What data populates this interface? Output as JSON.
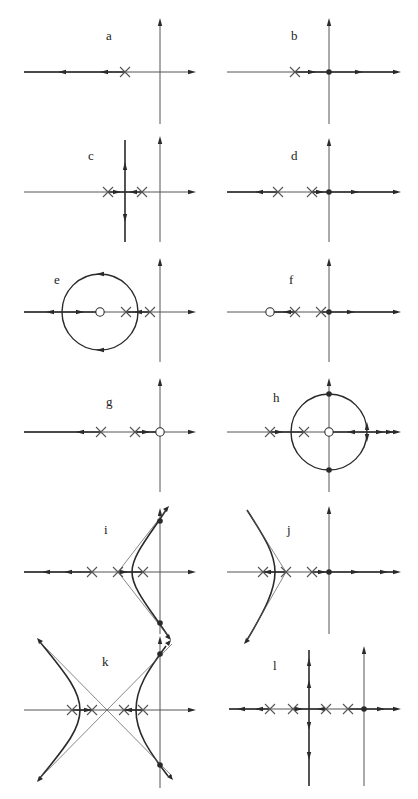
{
  "figure": {
    "ink_color": "#2a2a2a",
    "faint_color": "#555555"
  },
  "panels": [
    {
      "id": "a",
      "label": "a",
      "x": 0,
      "y": 0,
      "label_pos": [
        106,
        40
      ],
      "origin": [
        160,
        72
      ],
      "axes": {
        "left": 24,
        "right": 192,
        "top": 22,
        "bottom": 124
      },
      "poles": [
        [
          125,
          72
        ]
      ],
      "zeros": [],
      "dots": [],
      "lines": [
        [
          [
            24,
            72
          ],
          [
            125,
            72
          ]
        ]
      ],
      "circles": [],
      "curves": [],
      "dashed": [],
      "arrows": [
        [
          62,
          72,
          "left"
        ],
        [
          104,
          72,
          "left"
        ]
      ]
    },
    {
      "id": "b",
      "label": "b",
      "x": 209,
      "y": 0,
      "label_pos": [
        82,
        40
      ],
      "origin": [
        120,
        72
      ],
      "axes": {
        "left": 18,
        "right": 188,
        "top": 22,
        "bottom": 124
      },
      "poles": [
        [
          86,
          72
        ]
      ],
      "zeros": [],
      "dots": [
        [
          120,
          72
        ]
      ],
      "lines": [
        [
          [
            86,
            72
          ],
          [
            188,
            72
          ]
        ]
      ],
      "circles": [],
      "curves": [],
      "dashed": [],
      "arrows": [
        [
          103,
          72,
          "right"
        ],
        [
          150,
          72,
          "right"
        ]
      ]
    },
    {
      "id": "c",
      "label": "c",
      "x": 0,
      "y": 130,
      "label_pos": [
        88,
        30
      ],
      "origin": [
        160,
        62
      ],
      "axes": {
        "left": 24,
        "right": 192,
        "top": 10,
        "bottom": 112
      },
      "poles": [
        [
          108,
          62
        ],
        [
          142,
          62
        ]
      ],
      "zeros": [],
      "dots": [],
      "lines": [
        [
          [
            108,
            62
          ],
          [
            142,
            62
          ]
        ],
        [
          [
            125,
            10
          ],
          [
            125,
            112
          ]
        ]
      ],
      "circles": [],
      "curves": [],
      "dashed": [],
      "arrows": [
        [
          117,
          62,
          "right"
        ],
        [
          133,
          62,
          "left"
        ],
        [
          125,
          36,
          "up"
        ],
        [
          125,
          88,
          "down"
        ]
      ]
    },
    {
      "id": "d",
      "label": "d",
      "x": 209,
      "y": 130,
      "label_pos": [
        82,
        30
      ],
      "origin": [
        120,
        62
      ],
      "axes": {
        "left": 18,
        "right": 188,
        "top": 12,
        "bottom": 112
      },
      "poles": [
        [
          69,
          62
        ],
        [
          103,
          62
        ]
      ],
      "zeros": [],
      "dots": [
        [
          120,
          62
        ]
      ],
      "lines": [
        [
          [
            18,
            62
          ],
          [
            69,
            62
          ]
        ],
        [
          [
            103,
            62
          ],
          [
            188,
            62
          ]
        ]
      ],
      "circles": [],
      "curves": [],
      "dashed": [],
      "arrows": [
        [
          50,
          62,
          "left"
        ],
        [
          111,
          62,
          "right"
        ],
        [
          146,
          62,
          "right"
        ]
      ]
    },
    {
      "id": "e",
      "label": "e",
      "x": 0,
      "y": 250,
      "label_pos": [
        54,
        34
      ],
      "origin": [
        160,
        62
      ],
      "axes": {
        "left": 24,
        "right": 192,
        "top": 12,
        "bottom": 112
      },
      "poles": [
        [
          126,
          62
        ],
        [
          150,
          62
        ]
      ],
      "zeros": [
        [
          100,
          62
        ]
      ],
      "dots": [],
      "lines": [
        [
          [
            24,
            62
          ],
          [
            100,
            62
          ]
        ],
        [
          [
            126,
            62
          ],
          [
            150,
            62
          ]
        ]
      ],
      "circles": [
        [
          100,
          62,
          38
        ]
      ],
      "curves": [],
      "dashed": [],
      "arrows": [
        [
          50,
          62,
          "left"
        ],
        [
          80,
          62,
          "right"
        ],
        [
          138,
          62,
          "left"
        ],
        [
          100,
          24,
          "left"
        ],
        [
          100,
          100,
          "left"
        ]
      ]
    },
    {
      "id": "f",
      "label": "f",
      "x": 209,
      "y": 250,
      "label_pos": [
        80,
        34
      ],
      "origin": [
        120,
        62
      ],
      "axes": {
        "left": 18,
        "right": 188,
        "top": 12,
        "bottom": 112
      },
      "poles": [
        [
          86,
          62
        ],
        [
          112,
          62
        ]
      ],
      "zeros": [
        [
          61,
          62
        ]
      ],
      "dots": [
        [
          120,
          62
        ]
      ],
      "lines": [
        [
          [
            61,
            62
          ],
          [
            86,
            62
          ]
        ],
        [
          [
            112,
            62
          ],
          [
            188,
            62
          ]
        ]
      ],
      "circles": [],
      "curves": [],
      "dashed": [],
      "arrows": [
        [
          78,
          62,
          "left"
        ],
        [
          142,
          62,
          "right"
        ]
      ]
    },
    {
      "id": "g",
      "label": "g",
      "x": 0,
      "y": 380,
      "label_pos": [
        106,
        26
      ],
      "origin": [
        160,
        52
      ],
      "axes": {
        "left": 24,
        "right": 192,
        "top": 2,
        "bottom": 112
      },
      "poles": [
        [
          101,
          52
        ],
        [
          135,
          52
        ]
      ],
      "zeros": [
        [
          160,
          52
        ]
      ],
      "dots": [],
      "lines": [
        [
          [
            24,
            52
          ],
          [
            101,
            52
          ]
        ],
        [
          [
            135,
            52
          ],
          [
            160,
            52
          ]
        ]
      ],
      "circles": [],
      "curves": [],
      "dashed": [],
      "arrows": [
        [
          80,
          52,
          "left"
        ],
        [
          146,
          52,
          "right"
        ]
      ]
    },
    {
      "id": "h",
      "label": "h",
      "x": 209,
      "y": 380,
      "label_pos": [
        64,
        22
      ],
      "origin": [
        120,
        52
      ],
      "axes": {
        "left": 18,
        "right": 188,
        "top": 2,
        "bottom": 112
      },
      "poles": [
        [
          61,
          52
        ],
        [
          95,
          52
        ]
      ],
      "zeros": [
        [
          120,
          52
        ]
      ],
      "dots": [
        [
          120,
          14
        ],
        [
          120,
          90
        ]
      ],
      "lines": [
        [
          [
            61,
            52
          ],
          [
            95,
            52
          ]
        ],
        [
          [
            120,
            52
          ],
          [
            188,
            52
          ]
        ]
      ],
      "circles": [
        [
          120,
          52,
          38
        ]
      ],
      "curves": [],
      "dashed": [],
      "arrows": [
        [
          70,
          52,
          "right"
        ],
        [
          142,
          52,
          "left"
        ],
        [
          171,
          52,
          "right"
        ],
        [
          181,
          52,
          "right"
        ],
        [
          158,
          46,
          "up"
        ],
        [
          158,
          58,
          "down"
        ]
      ]
    },
    {
      "id": "i",
      "label": "i",
      "x": 0,
      "y": 510,
      "label_pos": [
        104,
        24
      ],
      "origin": [
        160,
        62
      ],
      "axes": {
        "left": 24,
        "right": 192,
        "top": 2,
        "bottom": 124
      },
      "poles": [
        [
          92,
          62
        ],
        [
          118,
          62
        ],
        [
          143,
          62
        ]
      ],
      "zeros": [],
      "dots": [
        [
          160,
          11
        ],
        [
          160,
          113
        ]
      ],
      "lines": [
        [
          [
            24,
            62
          ],
          [
            92,
            62
          ]
        ],
        [
          [
            118,
            62
          ],
          [
            143,
            62
          ]
        ]
      ],
      "circles": [],
      "curves": [
        "M 166 0 C 150 25, 132 45, 132 62 C 132 79, 150 99, 168 126"
      ],
      "dashed": [
        [
          "M 118 62 L 166 0"
        ],
        [
          "M 118 62 L 168 126"
        ]
      ],
      "arrows": [
        [
          46,
          62,
          "left"
        ],
        [
          68,
          62,
          "left"
        ],
        [
          124,
          62,
          "right"
        ],
        [
          166,
          0,
          "upright"
        ],
        [
          168,
          126,
          "downright"
        ]
      ]
    },
    {
      "id": "j",
      "label": "j",
      "x": 209,
      "y": 510,
      "label_pos": [
        78,
        24
      ],
      "origin": [
        120,
        62
      ],
      "axes": {
        "left": 18,
        "right": 188,
        "top": 0,
        "bottom": 124
      },
      "poles": [
        [
          54,
          62
        ],
        [
          77,
          62
        ],
        [
          103,
          62
        ]
      ],
      "zeros": [],
      "dots": [
        [
          120,
          62
        ]
      ],
      "lines": [
        [
          [
            54,
            62
          ],
          [
            77,
            62
          ]
        ],
        [
          [
            103,
            62
          ],
          [
            188,
            62
          ]
        ]
      ],
      "circles": [],
      "curves": [
        "M 38 0 C 56 28, 66 44, 66 62 C 66 80, 56 100, 38 130"
      ],
      "dashed": [
        [
          "M 77 62 L 38 0"
        ],
        [
          "M 77 62 L 38 130"
        ]
      ],
      "arrows": [
        [
          58,
          62,
          "left"
        ],
        [
          113,
          62,
          "right"
        ],
        [
          146,
          62,
          "right"
        ],
        [
          175,
          62,
          "right"
        ],
        [
          38,
          130,
          "downleft"
        ]
      ]
    },
    {
      "id": "k",
      "label": "k",
      "x": 0,
      "y": 640,
      "label_pos": [
        102,
        26
      ],
      "origin": [
        160,
        70
      ],
      "axes": {
        "left": 24,
        "right": 192,
        "top": 0,
        "bottom": 148
      },
      "poles": [
        [
          72,
          70
        ],
        [
          92,
          70
        ],
        [
          124,
          70
        ],
        [
          143,
          70
        ]
      ],
      "zeros": [],
      "dots": [
        [
          160,
          14
        ],
        [
          160,
          125
        ]
      ],
      "lines": [
        [
          [
            72,
            70
          ],
          [
            92,
            70
          ]
        ],
        [
          [
            124,
            70
          ],
          [
            143,
            70
          ]
        ]
      ],
      "circles": [],
      "curves": [
        "M 40 2 C 68 36, 80 52, 80 70 C 80 88, 68 104, 40 138",
        "M 166 6 C 148 30, 136 48, 136 70 C 136 92, 148 110, 168 136"
      ],
      "dashed": [
        [
          "M 40 2 L 172 136"
        ],
        [
          "M 40 138 L 172 4"
        ]
      ],
      "arrows": [
        [
          88,
          70,
          "right"
        ],
        [
          128,
          70,
          "left"
        ],
        [
          40,
          2,
          "upleft"
        ],
        [
          40,
          138,
          "downleft"
        ],
        [
          168,
          4,
          "upright"
        ],
        [
          170,
          136,
          "downright"
        ]
      ]
    },
    {
      "id": "l",
      "label": "l",
      "x": 209,
      "y": 640,
      "label_pos": [
        64,
        30
      ],
      "origin": [
        155,
        69
      ],
      "axes": {
        "left": 20,
        "right": 188,
        "top": 10,
        "bottom": 146
      },
      "poles": [
        [
          61,
          69
        ],
        [
          84,
          69
        ],
        [
          117,
          69
        ],
        [
          139,
          69
        ]
      ],
      "zeros": [],
      "dots": [
        [
          155,
          69
        ]
      ],
      "lines": [
        [
          [
            20,
            69
          ],
          [
            61,
            69
          ]
        ],
        [
          [
            84,
            69
          ],
          [
            117,
            69
          ]
        ],
        [
          [
            139,
            69
          ],
          [
            188,
            69
          ]
        ],
        [
          [
            100,
            10
          ],
          [
            100,
            146
          ]
        ]
      ],
      "circles": [],
      "curves": [],
      "dashed": [],
      "arrows": [
        [
          32,
          69,
          "left"
        ],
        [
          50,
          69,
          "left"
        ],
        [
          90,
          69,
          "right"
        ],
        [
          112,
          69,
          "left"
        ],
        [
          172,
          69,
          "right"
        ],
        [
          100,
          22,
          "up"
        ],
        [
          100,
          44,
          "up"
        ],
        [
          100,
          86,
          "down"
        ],
        [
          100,
          116,
          "down"
        ]
      ]
    }
  ]
}
